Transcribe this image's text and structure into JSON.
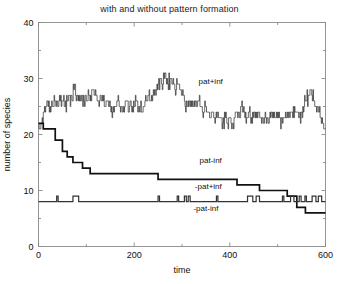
{
  "chart_data": {
    "type": "line",
    "title": "with and without pattern formation",
    "xlabel": "time",
    "ylabel": "number of species",
    "xlim": [
      0,
      600
    ],
    "ylim": [
      0,
      40
    ],
    "xticks": [
      0,
      200,
      400,
      600
    ],
    "yticks": [
      0,
      10,
      20,
      30,
      40
    ],
    "xtick_labels": [
      "0",
      "200",
      "400",
      "600"
    ],
    "ytick_labels": [
      "0",
      "10",
      "20",
      "30",
      "40"
    ],
    "minor_xticks": [
      100,
      300,
      500
    ],
    "minor_yticks": [
      5,
      15,
      25,
      35
    ],
    "grid": false,
    "legend_position": "inline-annotations",
    "series": [
      {
        "name": "pat+inf",
        "style": "thin-noisy-step",
        "color": "#2a2a2a",
        "label": "pat+inf",
        "label_x": 360,
        "label_y": 29,
        "x": [
          0,
          5,
          10,
          15,
          20,
          25,
          30,
          35,
          40,
          45,
          50,
          55,
          60,
          65,
          70,
          75,
          80,
          85,
          90,
          95,
          100,
          105,
          110,
          115,
          120,
          125,
          130,
          135,
          140,
          145,
          150,
          155,
          160,
          165,
          170,
          175,
          180,
          185,
          190,
          195,
          200,
          205,
          210,
          215,
          220,
          225,
          230,
          235,
          240,
          245,
          250,
          255,
          260,
          265,
          270,
          275,
          280,
          285,
          290,
          295,
          300,
          305,
          310,
          315,
          320,
          325,
          330,
          335,
          340,
          345,
          350,
          355,
          360,
          365,
          370,
          375,
          380,
          385,
          390,
          395,
          400,
          405,
          410,
          415,
          420,
          425,
          430,
          435,
          440,
          445,
          450,
          455,
          460,
          465,
          470,
          475,
          480,
          485,
          490,
          495,
          500,
          505,
          510,
          515,
          520,
          525,
          530,
          535,
          540,
          545,
          550,
          555,
          560,
          565,
          570,
          575,
          580,
          585,
          590,
          595,
          600
        ],
        "y": [
          22,
          22,
          24,
          25,
          25,
          24,
          25,
          26,
          25,
          26,
          26,
          25,
          26,
          27,
          26,
          29,
          27,
          26,
          27,
          26,
          26,
          27,
          26,
          28,
          27,
          26,
          27,
          26,
          25,
          26,
          25,
          24,
          25,
          26,
          25,
          24,
          25,
          26,
          25,
          24,
          25,
          26,
          25,
          24,
          25,
          26,
          27,
          26,
          28,
          27,
          29,
          30,
          29,
          31,
          29,
          30,
          29,
          28,
          29,
          28,
          27,
          26,
          25,
          26,
          25,
          26,
          25,
          26,
          25,
          24,
          25,
          24,
          23,
          24,
          23,
          24,
          23,
          22,
          23,
          22,
          23,
          22,
          23,
          24,
          23,
          26,
          24,
          23,
          24,
          23,
          24,
          23,
          24,
          23,
          22,
          23,
          22,
          23,
          24,
          23,
          24,
          23,
          22,
          23,
          24,
          23,
          24,
          25,
          24,
          23,
          24,
          25,
          26,
          27,
          28,
          26,
          25,
          24,
          23,
          22,
          21
        ]
      },
      {
        "name": "pat-inf",
        "style": "thick-step-decay",
        "color": "#111111",
        "label": "pat-inf",
        "label_x": 360,
        "label_y": 15,
        "x": [
          0,
          10,
          10,
          35,
          35,
          50,
          50,
          60,
          60,
          72,
          72,
          82,
          82,
          92,
          92,
          100,
          100,
          108,
          108,
          118,
          118,
          126,
          126,
          135,
          135,
          250,
          250,
          415,
          415,
          462,
          462,
          520,
          520,
          540,
          540,
          558,
          558,
          600
        ],
        "y": [
          22,
          22,
          21,
          21,
          19,
          19,
          17,
          17,
          16,
          16,
          15,
          15,
          15,
          15,
          14,
          14,
          14,
          14,
          13,
          13,
          13,
          13,
          13,
          13,
          13,
          13,
          12,
          12,
          11,
          11,
          10,
          10,
          9,
          9,
          7,
          7,
          6,
          6
        ]
      },
      {
        "name": "-pat+inf",
        "style": "flat-with-blips",
        "color": "#333333",
        "label": "-pat+inf",
        "label_x": 355,
        "label_y": 10.2,
        "baseline": 8,
        "blip_value": 9,
        "blips": [
          [
            38,
            41
          ],
          [
            72,
            84
          ],
          [
            250,
            253
          ],
          [
            290,
            293
          ],
          [
            305,
            309
          ],
          [
            313,
            317
          ],
          [
            372,
            375
          ],
          [
            437,
            448
          ],
          [
            455,
            462
          ],
          [
            510,
            513
          ],
          [
            527,
            534
          ],
          [
            545,
            549
          ],
          [
            557,
            560
          ],
          [
            572,
            580
          ],
          [
            585,
            592
          ]
        ]
      },
      {
        "name": "-pat-inf",
        "style": "label-only",
        "color": "#111111",
        "label": "-pat-inf",
        "label_x": 350,
        "label_y": 6.3,
        "constant_value": 8
      }
    ]
  }
}
